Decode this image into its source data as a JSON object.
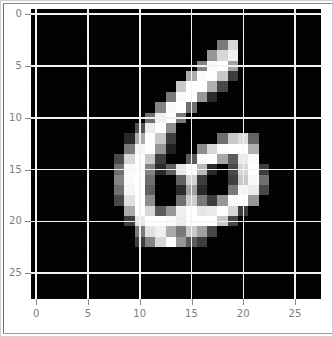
{
  "figure": {
    "kind": "imshow",
    "background": "#ffffff",
    "frame_color": "#cfcfcf",
    "width_px": 333,
    "height_px": 337
  },
  "axes": {
    "left_px": 30,
    "top_px": 8,
    "width_px": 290,
    "height_px": 290,
    "facecolor": "#000000",
    "grid_color": "#f2f2f2",
    "tick_color": "#8a8a8a",
    "tick_label_color": "#7d7d7d",
    "tick_label_size_px": 10
  },
  "chart_data": {
    "type": "heatmap",
    "title": "",
    "xlabel": "",
    "ylabel": "",
    "colormap": "gray",
    "vmin": 0,
    "vmax": 255,
    "origin": "upper",
    "grid": true,
    "legend": null,
    "legend_position": null,
    "xlim": [
      -0.5,
      27.5
    ],
    "ylim": [
      27.5,
      -0.5
    ],
    "shape": [
      28,
      28
    ],
    "xticks": [
      0,
      5,
      10,
      15,
      20,
      25
    ],
    "yticks": [
      0,
      5,
      10,
      15,
      20,
      25
    ],
    "xticklabels": [
      "0",
      "5",
      "10",
      "15",
      "20",
      "25"
    ],
    "yticklabels": [
      "0",
      "5",
      "10",
      "15",
      "20",
      "25"
    ],
    "depicts_digit": "6",
    "values": [
      [
        0,
        0,
        0,
        0,
        0,
        0,
        0,
        0,
        0,
        0,
        0,
        0,
        0,
        0,
        0,
        0,
        0,
        0,
        0,
        0,
        0,
        0,
        0,
        0,
        0,
        0,
        0,
        0
      ],
      [
        0,
        0,
        0,
        0,
        0,
        0,
        0,
        0,
        0,
        0,
        0,
        0,
        0,
        0,
        0,
        0,
        0,
        0,
        0,
        0,
        0,
        0,
        0,
        0,
        0,
        0,
        0,
        0
      ],
      [
        0,
        0,
        0,
        0,
        0,
        0,
        0,
        0,
        0,
        0,
        0,
        0,
        0,
        0,
        0,
        0,
        0,
        0,
        0,
        0,
        0,
        0,
        0,
        0,
        0,
        0,
        0,
        0
      ],
      [
        0,
        0,
        0,
        0,
        0,
        0,
        0,
        0,
        0,
        0,
        0,
        0,
        0,
        0,
        0,
        0,
        0,
        0,
        120,
        215,
        0,
        0,
        0,
        0,
        0,
        0,
        0,
        0
      ],
      [
        0,
        0,
        0,
        0,
        0,
        0,
        0,
        0,
        0,
        0,
        0,
        0,
        0,
        0,
        0,
        0,
        0,
        150,
        215,
        240,
        0,
        0,
        0,
        0,
        0,
        0,
        0,
        0
      ],
      [
        0,
        0,
        0,
        0,
        0,
        0,
        0,
        0,
        0,
        0,
        0,
        0,
        0,
        0,
        0,
        0,
        130,
        250,
        255,
        160,
        0,
        0,
        0,
        0,
        0,
        0,
        0,
        0
      ],
      [
        0,
        0,
        0,
        0,
        0,
        0,
        0,
        0,
        0,
        0,
        0,
        0,
        0,
        0,
        0,
        170,
        250,
        255,
        200,
        60,
        0,
        0,
        0,
        0,
        0,
        0,
        0,
        0
      ],
      [
        0,
        0,
        0,
        0,
        0,
        0,
        0,
        0,
        0,
        0,
        0,
        0,
        0,
        0,
        200,
        255,
        255,
        175,
        70,
        0,
        0,
        0,
        0,
        0,
        0,
        0,
        0,
        0
      ],
      [
        0,
        0,
        0,
        0,
        0,
        0,
        0,
        0,
        0,
        0,
        0,
        0,
        0,
        120,
        250,
        255,
        150,
        40,
        0,
        0,
        0,
        0,
        0,
        0,
        0,
        0,
        0,
        0
      ],
      [
        0,
        0,
        0,
        0,
        0,
        0,
        0,
        0,
        0,
        0,
        0,
        0,
        130,
        250,
        255,
        110,
        0,
        0,
        0,
        0,
        0,
        0,
        0,
        0,
        0,
        0,
        0,
        0
      ],
      [
        0,
        0,
        0,
        0,
        0,
        0,
        0,
        0,
        0,
        0,
        0,
        110,
        240,
        255,
        120,
        0,
        0,
        0,
        0,
        0,
        0,
        0,
        0,
        0,
        0,
        0,
        0,
        0
      ],
      [
        0,
        0,
        0,
        0,
        0,
        0,
        0,
        0,
        0,
        0,
        80,
        235,
        255,
        140,
        0,
        0,
        0,
        0,
        0,
        0,
        0,
        0,
        0,
        0,
        0,
        0,
        0,
        0
      ],
      [
        0,
        0,
        0,
        0,
        0,
        0,
        0,
        0,
        0,
        40,
        170,
        255,
        200,
        60,
        0,
        0,
        0,
        0,
        110,
        200,
        220,
        100,
        0,
        0,
        0,
        0,
        0,
        0
      ],
      [
        0,
        0,
        0,
        0,
        0,
        0,
        0,
        0,
        0,
        120,
        245,
        255,
        150,
        30,
        0,
        0,
        140,
        215,
        250,
        255,
        255,
        175,
        0,
        0,
        0,
        0,
        0,
        0
      ],
      [
        0,
        0,
        0,
        0,
        0,
        0,
        0,
        0,
        70,
        215,
        255,
        200,
        60,
        0,
        0,
        90,
        250,
        255,
        165,
        90,
        235,
        250,
        0,
        0,
        0,
        0,
        0,
        0
      ],
      [
        0,
        0,
        0,
        0,
        0,
        0,
        0,
        0,
        110,
        250,
        255,
        130,
        40,
        95,
        230,
        255,
        185,
        40,
        0,
        70,
        215,
        255,
        60,
        0,
        0,
        0,
        0,
        0
      ],
      [
        0,
        0,
        0,
        0,
        0,
        0,
        0,
        0,
        130,
        250,
        255,
        110,
        0,
        0,
        95,
        210,
        60,
        0,
        0,
        60,
        200,
        250,
        110,
        0,
        0,
        0,
        0,
        0
      ],
      [
        0,
        0,
        0,
        0,
        0,
        0,
        0,
        0,
        110,
        245,
        255,
        95,
        0,
        0,
        40,
        160,
        40,
        0,
        0,
        120,
        245,
        235,
        70,
        0,
        0,
        0,
        0,
        0
      ],
      [
        0,
        0,
        0,
        0,
        0,
        0,
        0,
        0,
        70,
        225,
        255,
        140,
        0,
        0,
        110,
        205,
        120,
        60,
        150,
        250,
        255,
        150,
        0,
        0,
        0,
        0,
        0,
        0
      ],
      [
        0,
        0,
        0,
        0,
        0,
        0,
        0,
        0,
        0,
        170,
        255,
        215,
        90,
        150,
        240,
        255,
        230,
        235,
        255,
        215,
        60,
        0,
        0,
        0,
        0,
        0,
        0,
        0
      ],
      [
        0,
        0,
        0,
        0,
        0,
        0,
        0,
        0,
        0,
        60,
        230,
        255,
        255,
        250,
        235,
        255,
        255,
        255,
        200,
        70,
        0,
        0,
        0,
        0,
        0,
        0,
        0,
        0
      ],
      [
        0,
        0,
        0,
        0,
        0,
        0,
        0,
        0,
        0,
        0,
        120,
        225,
        240,
        170,
        120,
        200,
        160,
        70,
        0,
        0,
        0,
        0,
        0,
        0,
        0,
        0,
        0,
        0
      ],
      [
        0,
        0,
        0,
        0,
        0,
        0,
        0,
        0,
        0,
        0,
        60,
        130,
        215,
        255,
        150,
        90,
        60,
        0,
        0,
        0,
        0,
        0,
        0,
        0,
        0,
        0,
        0,
        0
      ],
      [
        0,
        0,
        0,
        0,
        0,
        0,
        0,
        0,
        0,
        0,
        0,
        0,
        0,
        0,
        0,
        0,
        0,
        0,
        0,
        0,
        0,
        0,
        0,
        0,
        0,
        0,
        0,
        0
      ],
      [
        0,
        0,
        0,
        0,
        0,
        0,
        0,
        0,
        0,
        0,
        0,
        0,
        0,
        0,
        0,
        0,
        0,
        0,
        0,
        0,
        0,
        0,
        0,
        0,
        0,
        0,
        0,
        0
      ],
      [
        0,
        0,
        0,
        0,
        0,
        0,
        0,
        0,
        0,
        0,
        0,
        0,
        0,
        0,
        0,
        0,
        0,
        0,
        0,
        0,
        0,
        0,
        0,
        0,
        0,
        0,
        0,
        0
      ],
      [
        0,
        0,
        0,
        0,
        0,
        0,
        0,
        0,
        0,
        0,
        0,
        0,
        0,
        0,
        0,
        0,
        0,
        0,
        0,
        0,
        0,
        0,
        0,
        0,
        0,
        0,
        0,
        0
      ],
      [
        0,
        0,
        0,
        0,
        0,
        0,
        0,
        0,
        0,
        0,
        0,
        0,
        0,
        0,
        0,
        0,
        0,
        0,
        0,
        0,
        0,
        0,
        0,
        0,
        0,
        0,
        0,
        0
      ]
    ]
  }
}
